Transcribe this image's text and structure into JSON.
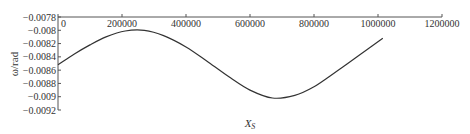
{
  "chart_data": {
    "type": "line",
    "title": "",
    "xlabel": "X_S",
    "ylabel": "ω/rad",
    "xlim": [
      0,
      1200000
    ],
    "ylim": [
      -0.0092,
      -0.0078
    ],
    "x_ticks": [
      0,
      200000,
      400000,
      600000,
      800000,
      1000000,
      1200000
    ],
    "x_tick_labels": [
      "0",
      "200000",
      "400000",
      "600000",
      "800000",
      "1000000",
      "1200000"
    ],
    "y_ticks": [
      -0.0078,
      -0.008,
      -0.0082,
      -0.0084,
      -0.0086,
      -0.0088,
      -0.009,
      -0.0092
    ],
    "y_tick_labels": [
      "-0.0078",
      "-0.008",
      "-0.0082",
      "-0.0084",
      "-0.0086",
      "-0.0088",
      "-0.009",
      "-0.0092"
    ],
    "x_axis_position": "top",
    "grid": false,
    "legend": null,
    "series": [
      {
        "name": "ω",
        "color": "#333333",
        "x": [
          0,
          50000,
          100000,
          150000,
          210000,
          270000,
          330000,
          400000,
          470000,
          540000,
          600000,
          670000,
          740000,
          800000,
          870000,
          940000,
          1015000
        ],
        "values": [
          -0.00852,
          -0.00836,
          -0.00822,
          -0.0081,
          -0.00801,
          -0.008,
          -0.00808,
          -0.00825,
          -0.00848,
          -0.00872,
          -0.0089,
          -0.00902,
          -0.00898,
          -0.00885,
          -0.00862,
          -0.00838,
          -0.00812
        ]
      }
    ]
  },
  "labels": {
    "xlabel_main": "X",
    "xlabel_sub": "S",
    "ylabel": "ω/rad"
  }
}
